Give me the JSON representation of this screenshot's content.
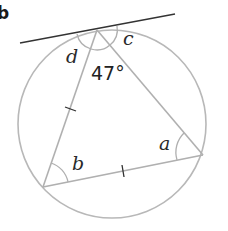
{
  "part_label": "b",
  "diagram": {
    "circle": {
      "cx": 112,
      "cy": 124,
      "r": 94,
      "color": "#b8b8b8"
    },
    "vertices": {
      "top": {
        "x": 97,
        "y": 30
      },
      "bottom_left": {
        "x": 43,
        "y": 187
      },
      "right": {
        "x": 203,
        "y": 155
      }
    },
    "tangent_line": {
      "x1": 20,
      "y1": 43,
      "x2": 175,
      "y2": 14,
      "color": "#333333"
    },
    "triangle_color": "#b0b0b0",
    "arc_color": "#b0b0b0",
    "labels": {
      "d": "d",
      "c": "c",
      "a": "a",
      "b": "b",
      "angle_top": "47°"
    },
    "equal_side_ticks": 2
  }
}
